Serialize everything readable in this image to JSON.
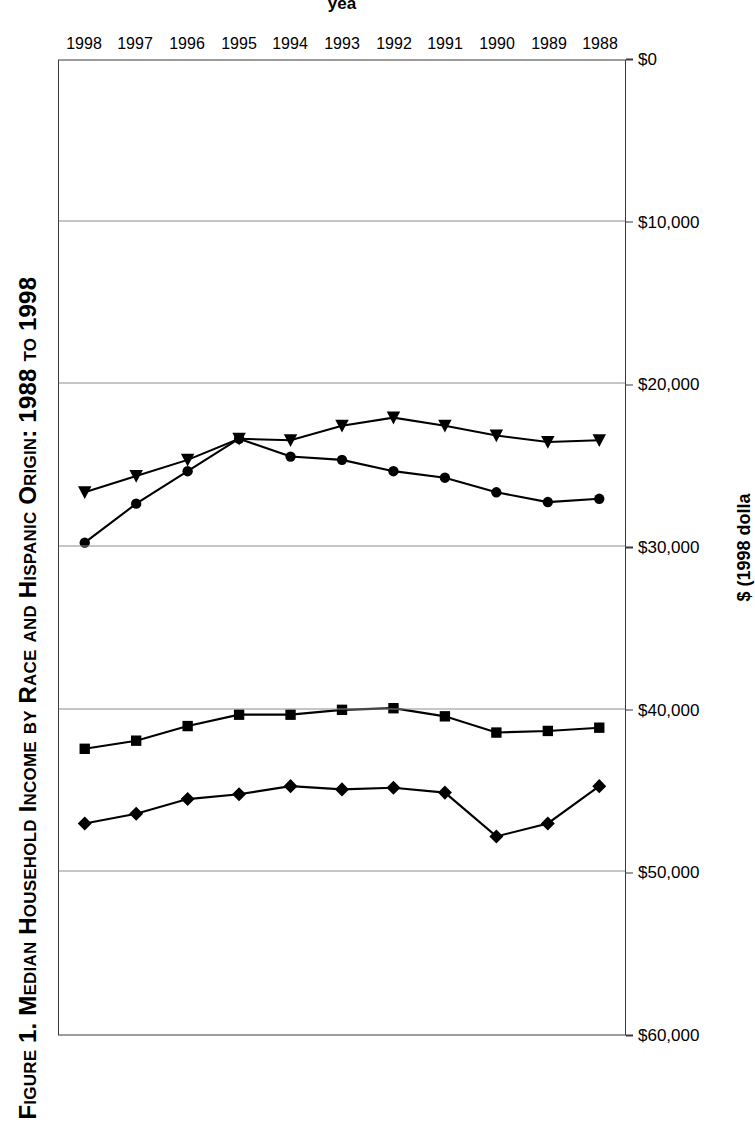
{
  "figure": {
    "title": "Figure 1. Median Household Income by Race and Hispanic Origin: 1988 to 1998",
    "orientation": "page rotated 90 degrees counter-clockwise",
    "background_color": "#ffffff",
    "line_color": "#000000",
    "grid_color": "#8d8d8d",
    "frame_color": "#3a3a3a"
  },
  "axes": {
    "value_axis": {
      "title": "$ (1998 dolla",
      "title_note": "clipped at page edge; intended '$ (1998 dollars)'",
      "ticks": [
        "$0",
        "$10,000",
        "$20,000",
        "$30,000",
        "$40,000",
        "$50,000",
        "$60,000"
      ],
      "min": 0,
      "max": 60000,
      "step": 10000
    },
    "category_axis": {
      "title": "yea",
      "title_note": "clipped at page edge; intended 'year'",
      "ticks": [
        "1988",
        "1989",
        "1990",
        "1991",
        "1992",
        "1993",
        "1994",
        "1995",
        "1996",
        "1997",
        "1998"
      ]
    }
  },
  "chart_data": {
    "type": "line",
    "title": "Figure 1. Median Household Income by Race and Hispanic Origin: 1988 to 1998",
    "xlabel": "year",
    "ylabel": "$ (1998 dollars)",
    "ylim": [
      0,
      60000
    ],
    "grid": true,
    "legend": "none",
    "x": [
      "1988",
      "1989",
      "1990",
      "1991",
      "1992",
      "1993",
      "1994",
      "1995",
      "1996",
      "1997",
      "1998"
    ],
    "series": [
      {
        "name": "Asian and Pacific Islander",
        "marker": "diamond",
        "values": [
          44700,
          47000,
          47800,
          45100,
          44800,
          44900,
          44700,
          45200,
          45500,
          46400,
          47000
        ]
      },
      {
        "name": "White",
        "marker": "square",
        "values": [
          41100,
          41300,
          41400,
          40400,
          39900,
          40000,
          40300,
          40300,
          41000,
          41900,
          42400
        ]
      },
      {
        "name": "Hispanic origin",
        "marker": "circle",
        "values": [
          27000,
          27200,
          26600,
          25700,
          25300,
          24600,
          24400,
          23300,
          25300,
          27300,
          29700
        ]
      },
      {
        "name": "Black",
        "marker": "triangle",
        "values": [
          23400,
          23500,
          23100,
          22500,
          22000,
          22500,
          23400,
          23300,
          24600,
          25600,
          26600
        ]
      }
    ]
  }
}
